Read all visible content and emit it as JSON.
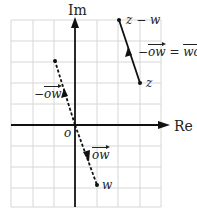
{
  "diagram": {
    "axes": {
      "x_label": "Re",
      "y_label": "Im",
      "origin_label": "o"
    },
    "grid": {
      "cols": 7,
      "rows": 9
    },
    "points": {
      "z": {
        "label": "z",
        "grid": [
          3,
          2
        ]
      },
      "z_minus_w": {
        "label": "z − w",
        "grid": [
          2,
          5
        ]
      },
      "w": {
        "label": "w",
        "grid": [
          1,
          -3
        ]
      },
      "neg_w": {
        "label": "",
        "grid": [
          -1,
          3
        ]
      },
      "o": {
        "label": "o",
        "grid": [
          0,
          0
        ]
      }
    },
    "vectors": {
      "ow": {
        "label": "ow",
        "style": "dashed",
        "from": "o",
        "to": "w"
      },
      "neg_ow": {
        "label_prefix": "−",
        "label": "ow",
        "style": "dashed",
        "from": "o",
        "to": "neg_w"
      },
      "wo": {
        "label_prefix": "−",
        "label_left": "ow",
        "equals": "=",
        "label_right": "wo",
        "style": "solid",
        "from": "z",
        "to": "z_minus_w"
      }
    }
  }
}
